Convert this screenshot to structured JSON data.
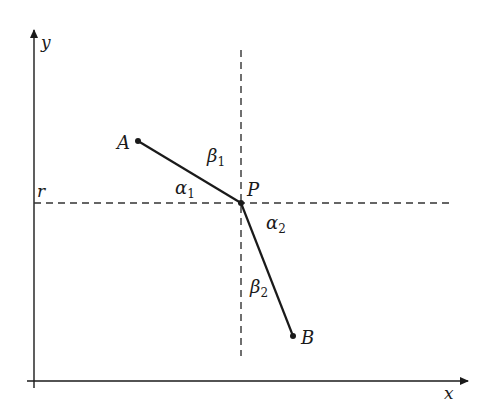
{
  "diagram": {
    "axes": {
      "x_label": "x",
      "y_label": "y"
    },
    "reference_line_label": "r",
    "points": {
      "A": {
        "label": "A",
        "x": 138,
        "y": 141
      },
      "P": {
        "label": "P",
        "x": 241,
        "y": 203
      },
      "B": {
        "label": "B",
        "x": 293,
        "y": 336
      }
    },
    "angles": {
      "alpha1": {
        "symbol": "α",
        "sub": "1"
      },
      "beta1": {
        "symbol": "β",
        "sub": "1"
      },
      "alpha2": {
        "symbol": "α",
        "sub": "2"
      },
      "beta2": {
        "symbol": "β",
        "sub": "2"
      }
    },
    "colors": {
      "ink": "#1a1a1a",
      "dash": "#333333",
      "background": "#ffffff"
    }
  }
}
